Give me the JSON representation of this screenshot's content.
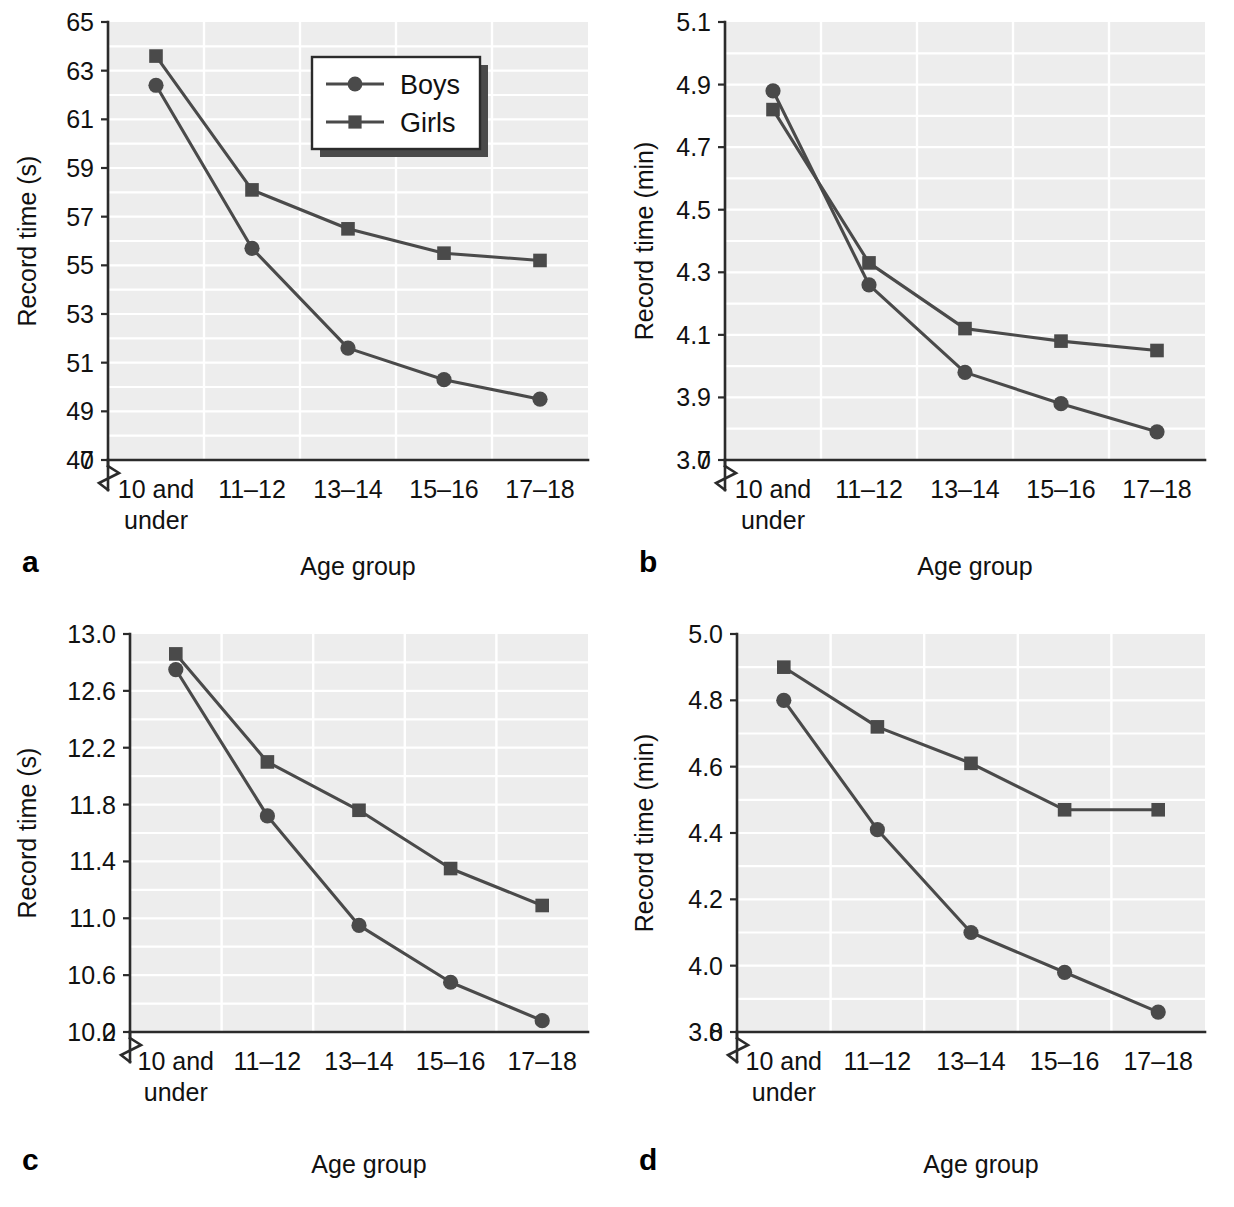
{
  "figure": {
    "panel_letters": [
      "a",
      "b",
      "c",
      "d"
    ],
    "legend": {
      "entries": [
        {
          "label": "Boys",
          "marker": "circle-marker"
        },
        {
          "label": "Girls",
          "marker": "square-marker"
        }
      ],
      "position": "top-right of panel a"
    },
    "series_color": "#4a4a4a",
    "plot_background": "#ededed",
    "gridline_color": "#ffffff",
    "axis_color": "#2b2b2b"
  },
  "chart_data": [
    {
      "type": "line",
      "panel": "a",
      "title": "",
      "xlabel": "Age group",
      "ylabel": "Record time (s)",
      "categories": [
        "10 and under",
        "11–12",
        "13–14",
        "15–16",
        "17–18"
      ],
      "yticks": [
        47,
        49,
        51,
        53,
        55,
        57,
        59,
        61,
        63,
        65
      ],
      "ytick_labels": [
        "47",
        "49",
        "51",
        "53",
        "55",
        "57",
        "59",
        "61",
        "63",
        "65"
      ],
      "origin_label": "0",
      "axis_break": true,
      "ylim": [
        47,
        65
      ],
      "grid": true,
      "legend_position": "upper right",
      "series": [
        {
          "name": "Boys",
          "marker": "circle",
          "values": [
            62.4,
            55.7,
            51.6,
            50.3,
            49.5
          ]
        },
        {
          "name": "Girls",
          "marker": "square",
          "values": [
            63.6,
            58.1,
            56.5,
            55.5,
            55.2
          ]
        }
      ]
    },
    {
      "type": "line",
      "panel": "b",
      "title": "",
      "xlabel": "Age group",
      "ylabel": "Record time (min)",
      "categories": [
        "10 and under",
        "11–12",
        "13–14",
        "15–16",
        "17–18"
      ],
      "yticks": [
        3.7,
        3.9,
        4.1,
        4.3,
        4.5,
        4.7,
        4.9,
        5.1
      ],
      "ytick_labels": [
        "3.7",
        "3.9",
        "4.1",
        "4.3",
        "4.5",
        "4.7",
        "4.9",
        "5.1"
      ],
      "origin_label": "0",
      "axis_break": true,
      "ylim": [
        3.7,
        5.1
      ],
      "grid": true,
      "legend_position": "none",
      "series": [
        {
          "name": "Boys",
          "marker": "circle",
          "values": [
            4.88,
            4.26,
            3.98,
            3.88,
            3.79
          ]
        },
        {
          "name": "Girls",
          "marker": "square",
          "values": [
            4.82,
            4.33,
            4.12,
            4.08,
            4.05
          ]
        }
      ]
    },
    {
      "type": "line",
      "panel": "c",
      "title": "",
      "xlabel": "Age group",
      "ylabel": "Record time (s)",
      "categories": [
        "10 and under",
        "11–12",
        "13–14",
        "15–16",
        "17–18"
      ],
      "yticks": [
        10.2,
        10.6,
        11.0,
        11.4,
        11.8,
        12.2,
        12.6,
        13.0
      ],
      "ytick_labels": [
        "10.2",
        "10.6",
        "11.0",
        "11.4",
        "11.8",
        "12.2",
        "12.6",
        "13.0"
      ],
      "origin_label": "0",
      "axis_break": true,
      "ylim": [
        10.2,
        13.0
      ],
      "grid": true,
      "legend_position": "none",
      "series": [
        {
          "name": "Boys",
          "marker": "circle",
          "values": [
            12.75,
            11.72,
            10.95,
            10.55,
            10.28
          ]
        },
        {
          "name": "Girls",
          "marker": "square",
          "values": [
            12.86,
            12.1,
            11.76,
            11.35,
            11.09
          ]
        }
      ]
    },
    {
      "type": "line",
      "panel": "d",
      "title": "",
      "xlabel": "Age group",
      "ylabel": "Record time (min)",
      "categories": [
        "10 and under",
        "11–12",
        "13–14",
        "15–16",
        "17–18"
      ],
      "yticks": [
        3.8,
        4.0,
        4.2,
        4.4,
        4.6,
        4.8,
        5.0
      ],
      "ytick_labels": [
        "3.8",
        "4.0",
        "4.2",
        "4.4",
        "4.6",
        "4.8",
        "5.0"
      ],
      "origin_label": "0",
      "axis_break": true,
      "ylim": [
        3.8,
        5.0
      ],
      "grid": true,
      "legend_position": "none",
      "series": [
        {
          "name": "Boys",
          "marker": "circle",
          "values": [
            4.8,
            4.41,
            4.1,
            3.98,
            3.86
          ]
        },
        {
          "name": "Girls",
          "marker": "square",
          "values": [
            4.9,
            4.72,
            4.61,
            4.47,
            4.47
          ]
        }
      ]
    }
  ]
}
